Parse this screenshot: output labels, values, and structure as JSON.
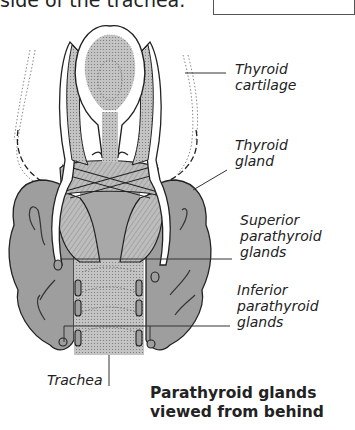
{
  "header": {
    "text": "side of the trachea."
  },
  "labels": {
    "thyroid_cartilage": [
      "Thyroid",
      "cartilage"
    ],
    "thyroid_gland": [
      "Thyroid",
      "gland"
    ],
    "superior_parathyroid": [
      "Superior",
      "parathyroid",
      "glands"
    ],
    "inferior_parathyroid": [
      "Inferior",
      "parathyroid",
      "glands"
    ],
    "trachea": "Trachea"
  },
  "caption": {
    "line1": "Parathyroid glands",
    "line2": "viewed from behind"
  },
  "colors": {
    "gland_fill": "#9e9e9e",
    "light_fill": "#c9c9c9",
    "outline": "#222222"
  }
}
